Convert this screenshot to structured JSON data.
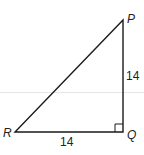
{
  "diagram": {
    "type": "right-triangle",
    "vertices": {
      "P": "P",
      "Q": "Q",
      "R": "R"
    },
    "sides": {
      "PQ": "14",
      "RQ": "14"
    },
    "right_angle_at": "Q",
    "stroke_color": "#1a1a1a"
  }
}
